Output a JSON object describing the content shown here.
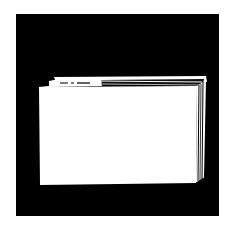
{
  "illustration": {
    "subject": "file-folder",
    "colors": {
      "background": "#ffffff",
      "frame": "#000000",
      "folder": "#ffffff",
      "ink": "#000000"
    },
    "tab_label": ""
  }
}
